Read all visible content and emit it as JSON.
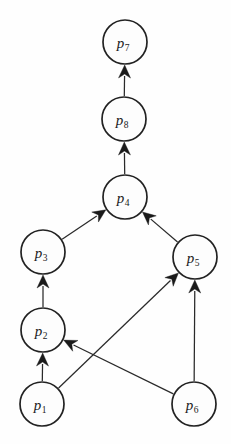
{
  "diagram": {
    "type": "directed-graph",
    "background_color": "#fefefe",
    "node_fill_color": "#fdfdfd",
    "node_stroke_color": "#222222",
    "edge_color": "#2a2a2a",
    "arrow_color": "#1a1a1a",
    "node_radius": 22,
    "nodes": [
      {
        "id": "p1",
        "base": "p",
        "sub": "1",
        "label": "p1",
        "cx": 42,
        "cy": 404
      },
      {
        "id": "p2",
        "base": "p",
        "sub": "2",
        "label": "p2",
        "cx": 43,
        "cy": 330
      },
      {
        "id": "p3",
        "base": "p",
        "sub": "3",
        "label": "p3",
        "cx": 43,
        "cy": 252
      },
      {
        "id": "p4",
        "base": "p",
        "sub": "4",
        "label": "p4",
        "cx": 125,
        "cy": 197
      },
      {
        "id": "p5",
        "base": "p",
        "sub": "5",
        "label": "p5",
        "cx": 195,
        "cy": 257
      },
      {
        "id": "p6",
        "base": "p",
        "sub": "6",
        "label": "p6",
        "cx": 194,
        "cy": 404
      },
      {
        "id": "p7",
        "base": "p",
        "sub": "7",
        "label": "p7",
        "cx": 125,
        "cy": 42
      },
      {
        "id": "p8",
        "base": "p",
        "sub": "8",
        "label": "p8",
        "cx": 124,
        "cy": 119
      }
    ],
    "edges": [
      {
        "id": "e1",
        "from": "p1",
        "to": "p2",
        "label": ""
      },
      {
        "id": "e2",
        "from": "p1",
        "to": "p5",
        "label": ""
      },
      {
        "id": "e3",
        "from": "p6",
        "to": "p2",
        "label": ""
      },
      {
        "id": "e4",
        "from": "p6",
        "to": "p5",
        "label": ""
      },
      {
        "id": "e5",
        "from": "p2",
        "to": "p3",
        "label": ""
      },
      {
        "id": "e6",
        "from": "p3",
        "to": "p4",
        "label": ""
      },
      {
        "id": "e7",
        "from": "p5",
        "to": "p4",
        "label": ""
      },
      {
        "id": "e8",
        "from": "p4",
        "to": "p8",
        "label": ""
      },
      {
        "id": "e9",
        "from": "p8",
        "to": "p7",
        "label": ""
      }
    ]
  }
}
